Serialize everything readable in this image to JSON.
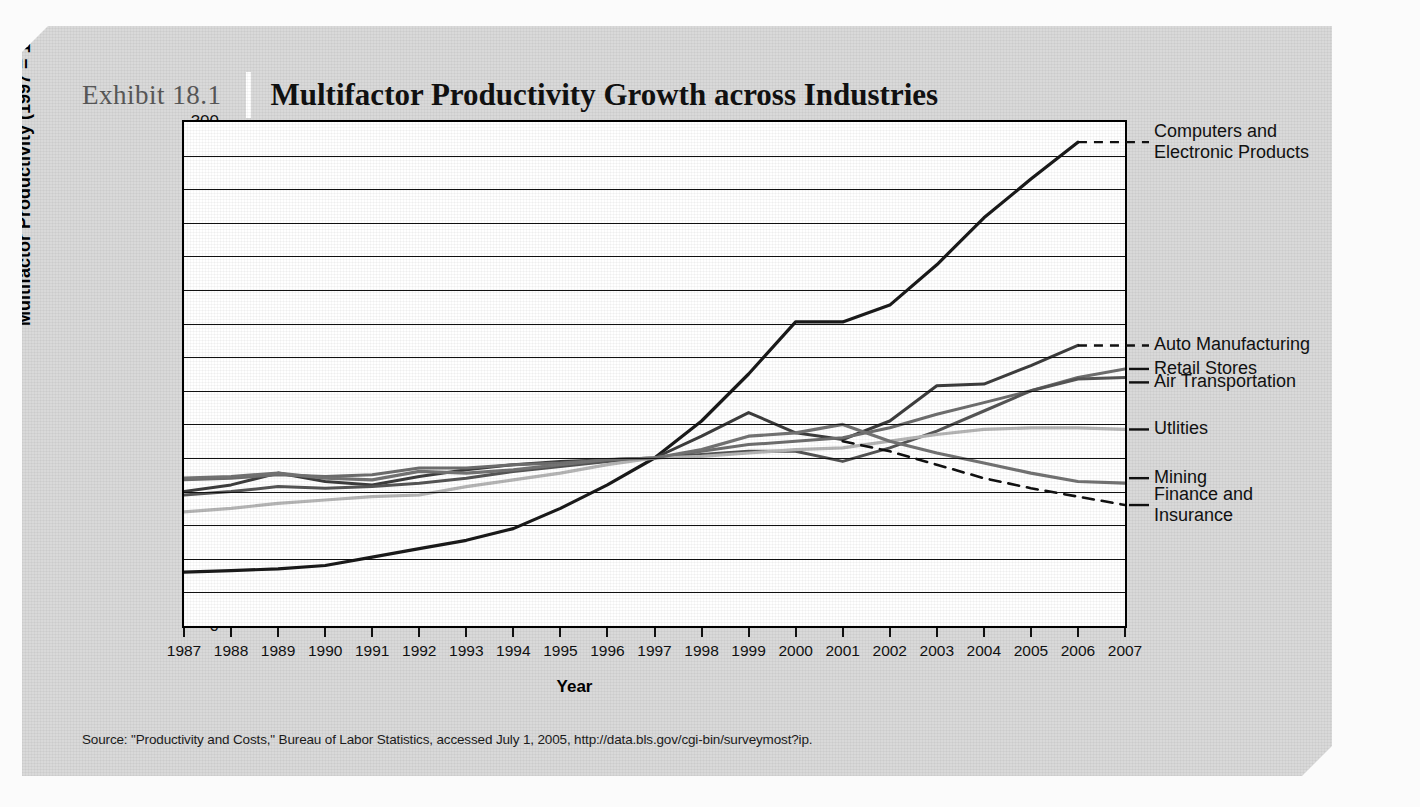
{
  "exhibit": {
    "number": "Exhibit 18.1",
    "title": "Multifactor Productivity Growth across Industries"
  },
  "source": "Source: \"Productivity and Costs,\" Bureau of Labor Statistics, accessed July 1, 2005, http://data.bls.gov/cgi-bin/surveymost?ip.",
  "chart_data": {
    "type": "line",
    "title": "Multifactor Productivity Growth across Industries",
    "xlabel": "Year",
    "ylabel": "Multifactor Productivity (1997 = 100)",
    "xlim": [
      1987,
      2007
    ],
    "ylim": [
      0,
      300
    ],
    "ytick_step": 20,
    "yticks": [
      300,
      280,
      260,
      240,
      220,
      200,
      180,
      160,
      140,
      120,
      100,
      80,
      60,
      40,
      20,
      0
    ],
    "grid": true,
    "legend_position": "right-of-axes",
    "categories": [
      1987,
      1988,
      1989,
      1990,
      1991,
      1992,
      1993,
      1994,
      1995,
      1996,
      1997,
      1998,
      1999,
      2000,
      2001,
      2002,
      2003,
      2004,
      2005,
      2006,
      2007
    ],
    "xticklabels": [
      "1987",
      "1988",
      "1989",
      "1990",
      "1991",
      "1992",
      "1993",
      "1994",
      "1995",
      "1996",
      "1997",
      "1998",
      "1999",
      "2000",
      "2001",
      "2002",
      "2003",
      "2004",
      "2005",
      "2006",
      "2007"
    ],
    "series": [
      {
        "name": "Computers and Electronic Products",
        "label": "Computers and\nElectronic Products",
        "color": "#1a1a1a",
        "width": 3.2,
        "leader_y": 288,
        "values": [
          32,
          33,
          34,
          36,
          41,
          46,
          51,
          58,
          70,
          84,
          100,
          122,
          150,
          181,
          181,
          191,
          215,
          243,
          266,
          288,
          null
        ]
      },
      {
        "name": "Auto Manufacturing",
        "label": "Auto Manufacturing",
        "color": "#3d3d3d",
        "width": 3.0,
        "leader_y": 167,
        "values": [
          80,
          84,
          91,
          86,
          84,
          89,
          93,
          96,
          98,
          99,
          100,
          113,
          127,
          115,
          111,
          122,
          143,
          144,
          155,
          167,
          null
        ]
      },
      {
        "name": "Retail Stores",
        "label": "Retail Stores",
        "color": "#6e6e6e",
        "width": 3.0,
        "leader_y": 153,
        "values": [
          87,
          88,
          90,
          89,
          90,
          94,
          94,
          96,
          97,
          99,
          100,
          104,
          108,
          110,
          112,
          118,
          126,
          133,
          140,
          148,
          153
        ]
      },
      {
        "name": "Air Transportation",
        "label": "Air Transportation",
        "color": "#555555",
        "width": 3.0,
        "leader_y": 145,
        "values": [
          78,
          80,
          83,
          82,
          83,
          85,
          88,
          92,
          95,
          98,
          100,
          102,
          104,
          104,
          98,
          106,
          116,
          128,
          140,
          147,
          148
        ]
      },
      {
        "name": "Utlities",
        "label": "Utlities",
        "color": "#b5b5b5",
        "width": 3.2,
        "leader_y": 117,
        "values": [
          68,
          70,
          73,
          75,
          77,
          78,
          83,
          87,
          91,
          96,
          100,
          101,
          103,
          105,
          106,
          110,
          114,
          117,
          118,
          118,
          117
        ]
      },
      {
        "name": "Mining",
        "label": "Mining",
        "color": "#737373",
        "width": 3.2,
        "leader_y": 88,
        "values": [
          88,
          89,
          91,
          88,
          87,
          92,
          91,
          93,
          96,
          99,
          100,
          105,
          113,
          115,
          120,
          110,
          103,
          97,
          91,
          86,
          85
        ]
      },
      {
        "name": "Finance and Insurance",
        "label": "Finance and\nInsurance",
        "color": "#111111",
        "width": 2.6,
        "dashed": true,
        "leader_y": 72,
        "values": [
          null,
          null,
          null,
          null,
          null,
          null,
          null,
          null,
          null,
          null,
          null,
          null,
          null,
          null,
          110,
          104,
          96,
          88,
          82,
          77,
          72
        ]
      }
    ]
  }
}
